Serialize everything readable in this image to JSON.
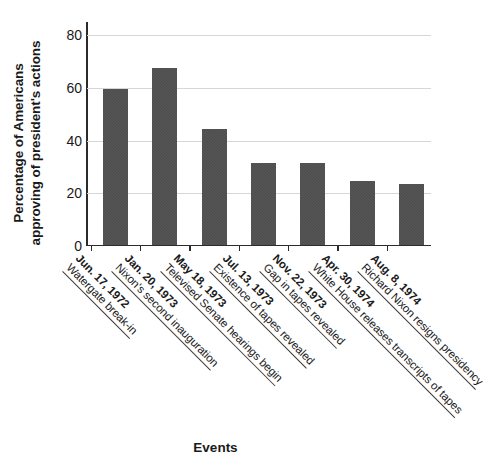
{
  "chart_data": {
    "type": "bar",
    "title": "",
    "xlabel": "Events",
    "ylabel_line1": "Percentage of Americans",
    "ylabel_line2": "approving of president's actions",
    "ylim": [
      0,
      85
    ],
    "yticks": [
      0,
      20,
      40,
      60,
      80
    ],
    "ytick_labels": [
      "0",
      "20",
      "40",
      "60",
      "80"
    ],
    "grid": true,
    "legend": "none",
    "bar_color": "#4b4b4b",
    "categories": [
      "Jun. 17, 1972 Watergate break-in",
      "Jan. 20, 1973 Nixon's second inauguration",
      "May 18, 1973 Televised Senate hearings begin",
      "Jul. 13, 1973 Existence of tapes revealed",
      "Nov. 22, 1973 Gap in tapes revealed",
      "Apr. 30, 1974 White House releases transcripts of tapes",
      "Aug. 8, 1974 Richard Nixon resigns presidency"
    ],
    "values": [
      59,
      67,
      44,
      31,
      31,
      24,
      23
    ],
    "points": [
      {
        "date": "Jun. 17, 1972",
        "event": "Watergate break-in",
        "value": 59
      },
      {
        "date": "Jan. 20, 1973",
        "event": "Nixon's second inauguration",
        "value": 67
      },
      {
        "date": "May 18, 1973",
        "event": "Televised Senate hearings begin",
        "value": 44
      },
      {
        "date": "Jul. 13, 1973",
        "event": "Existence of tapes revealed",
        "value": 31
      },
      {
        "date": "Nov. 22, 1973",
        "event": "Gap in tapes revealed",
        "value": 31
      },
      {
        "date": "Apr. 30, 1974",
        "event": "White House releases transcripts of tapes",
        "value": 24
      },
      {
        "date": "Aug. 8, 1974",
        "event": "Richard Nixon resigns presidency",
        "value": 23
      }
    ]
  }
}
